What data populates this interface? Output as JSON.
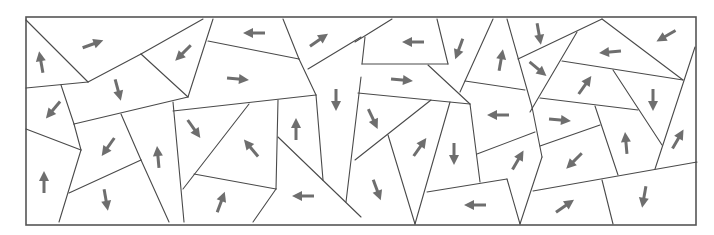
{
  "diagram": {
    "type": "polygon-tiling-with-direction-arrows",
    "frame": {
      "x": 26,
      "y": 17,
      "width": 670,
      "height": 208
    },
    "colors": {
      "edge": "#4a4a4a",
      "frame": "#555555",
      "arrow": "#6e6e6e",
      "background": "#ffffff"
    },
    "arrow_length": 22,
    "edges": [
      [
        26,
        20,
        88,
        82
      ],
      [
        88,
        82,
        141,
        54
      ],
      [
        141,
        54,
        203,
        19
      ],
      [
        141,
        54,
        188,
        97
      ],
      [
        213,
        19,
        188,
        97
      ],
      [
        26,
        88,
        88,
        82
      ],
      [
        61,
        85,
        74,
        124
      ],
      [
        74,
        124,
        188,
        97
      ],
      [
        26,
        129,
        81,
        150
      ],
      [
        74,
        124,
        81,
        150
      ],
      [
        81,
        150,
        59,
        222
      ],
      [
        69,
        193,
        141,
        160
      ],
      [
        121,
        114,
        141,
        160
      ],
      [
        141,
        160,
        169,
        222
      ],
      [
        208,
        41,
        299,
        59
      ],
      [
        299,
        59,
        316,
        95
      ],
      [
        283,
        19,
        299,
        59
      ],
      [
        308,
        69,
        361,
        37
      ],
      [
        173,
        111,
        316,
        95
      ],
      [
        173,
        102,
        184,
        222
      ],
      [
        249,
        104,
        183,
        189
      ],
      [
        194,
        174,
        276,
        189
      ],
      [
        276,
        189,
        253,
        222
      ],
      [
        278,
        100,
        276,
        189
      ],
      [
        278,
        137,
        361,
        217
      ],
      [
        316,
        95,
        323,
        180
      ],
      [
        361,
        77,
        346,
        202
      ],
      [
        355,
        42,
        392,
        19
      ],
      [
        365,
        37,
        362,
        64
      ],
      [
        362,
        64,
        448,
        64
      ],
      [
        437,
        19,
        448,
        64
      ],
      [
        428,
        65,
        470,
        104
      ],
      [
        358,
        93,
        470,
        104
      ],
      [
        493,
        19,
        460,
        92
      ],
      [
        507,
        19,
        532,
        107
      ],
      [
        532,
        107,
        542,
        157
      ],
      [
        542,
        157,
        520,
        224
      ],
      [
        465,
        81,
        525,
        90
      ],
      [
        470,
        104,
        480,
        182
      ],
      [
        431,
        100,
        355,
        160
      ],
      [
        388,
        135,
        415,
        224
      ],
      [
        450,
        102,
        415,
        224
      ],
      [
        427,
        192,
        507,
        179
      ],
      [
        507,
        179,
        520,
        224
      ],
      [
        477,
        154,
        535,
        132
      ],
      [
        518,
        59,
        602,
        19
      ],
      [
        577,
        32,
        530,
        112
      ],
      [
        602,
        19,
        683,
        80
      ],
      [
        562,
        61,
        683,
        80
      ],
      [
        613,
        70,
        662,
        145
      ],
      [
        540,
        98,
        638,
        110
      ],
      [
        595,
        106,
        618,
        175
      ],
      [
        540,
        146,
        600,
        125
      ],
      [
        695,
        47,
        655,
        169
      ],
      [
        533,
        191,
        697,
        162
      ],
      [
        602,
        180,
        613,
        224
      ]
    ],
    "arrows": [
      {
        "x": 41,
        "y": 62,
        "angle": -100
      },
      {
        "x": 93,
        "y": 44,
        "angle": -20
      },
      {
        "x": 183,
        "y": 53,
        "angle": 135
      },
      {
        "x": 254,
        "y": 33,
        "angle": 180
      },
      {
        "x": 319,
        "y": 40,
        "angle": -35
      },
      {
        "x": 118,
        "y": 90,
        "angle": 75
      },
      {
        "x": 238,
        "y": 79,
        "angle": 5
      },
      {
        "x": 336,
        "y": 100,
        "angle": 90
      },
      {
        "x": 53,
        "y": 110,
        "angle": 130
      },
      {
        "x": 194,
        "y": 129,
        "angle": 55
      },
      {
        "x": 251,
        "y": 148,
        "angle": -130
      },
      {
        "x": 296,
        "y": 129,
        "angle": -90
      },
      {
        "x": 108,
        "y": 147,
        "angle": 125
      },
      {
        "x": 158,
        "y": 157,
        "angle": -95
      },
      {
        "x": 44,
        "y": 182,
        "angle": -90
      },
      {
        "x": 106,
        "y": 200,
        "angle": 80
      },
      {
        "x": 221,
        "y": 202,
        "angle": -70
      },
      {
        "x": 303,
        "y": 196,
        "angle": 180
      },
      {
        "x": 413,
        "y": 42,
        "angle": 180
      },
      {
        "x": 459,
        "y": 49,
        "angle": 110
      },
      {
        "x": 501,
        "y": 60,
        "angle": -80
      },
      {
        "x": 539,
        "y": 34,
        "angle": 80
      },
      {
        "x": 610,
        "y": 52,
        "angle": 175
      },
      {
        "x": 666,
        "y": 36,
        "angle": 150
      },
      {
        "x": 402,
        "y": 80,
        "angle": 5
      },
      {
        "x": 538,
        "y": 69,
        "angle": 40
      },
      {
        "x": 585,
        "y": 85,
        "angle": -55
      },
      {
        "x": 653,
        "y": 100,
        "angle": 90
      },
      {
        "x": 373,
        "y": 119,
        "angle": 65
      },
      {
        "x": 498,
        "y": 115,
        "angle": 180
      },
      {
        "x": 560,
        "y": 120,
        "angle": 5
      },
      {
        "x": 420,
        "y": 147,
        "angle": -55
      },
      {
        "x": 454,
        "y": 154,
        "angle": 90
      },
      {
        "x": 518,
        "y": 160,
        "angle": -60
      },
      {
        "x": 574,
        "y": 161,
        "angle": 135
      },
      {
        "x": 626,
        "y": 143,
        "angle": -95
      },
      {
        "x": 678,
        "y": 139,
        "angle": -60
      },
      {
        "x": 377,
        "y": 190,
        "angle": 70
      },
      {
        "x": 475,
        "y": 205,
        "angle": 180
      },
      {
        "x": 565,
        "y": 206,
        "angle": -35
      },
      {
        "x": 644,
        "y": 197,
        "angle": 100
      }
    ]
  }
}
